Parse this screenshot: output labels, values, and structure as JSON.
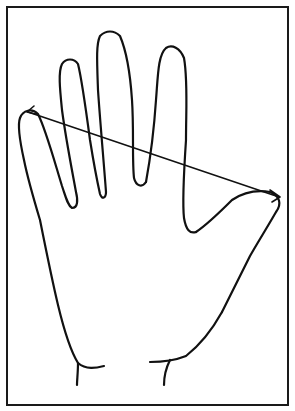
{
  "figure": {
    "title": "",
    "colors": {
      "background": "#ffffff",
      "stroke": "#111111",
      "frame": "#1a1a1a"
    },
    "frame": {
      "x": 7,
      "y": 7,
      "width": 281,
      "height": 398
    },
    "measurement": {
      "type": "double-arrow",
      "label": "",
      "from": {
        "name": "little-finger-tip",
        "x": 28,
        "y": 112
      },
      "to": {
        "name": "thumb-tip",
        "x": 279,
        "y": 197
      }
    },
    "parts": [
      "little-finger",
      "ring-finger",
      "middle-finger",
      "index-finger",
      "thumb",
      "palm",
      "wrist"
    ]
  }
}
